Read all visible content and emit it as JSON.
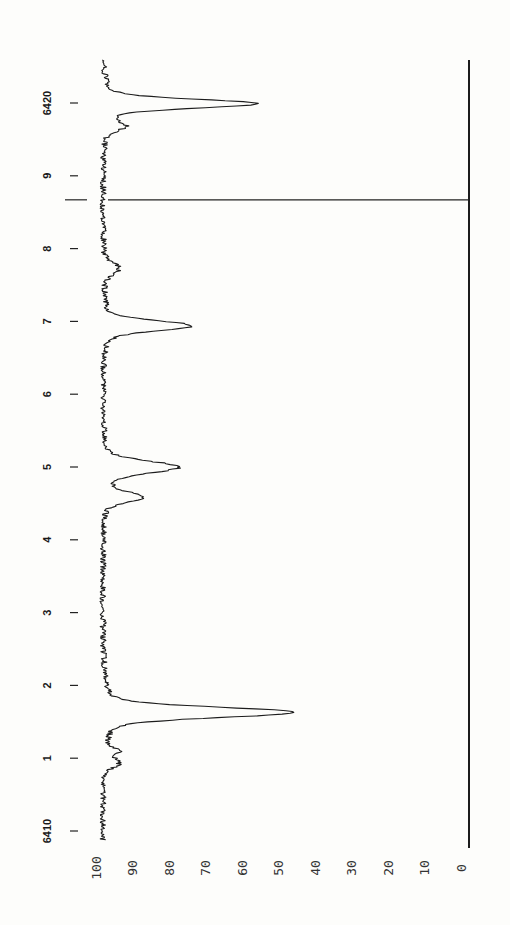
{
  "chart_data": {
    "type": "line",
    "title": "",
    "orientation": "rotated-90",
    "xlabel": "Wavelength",
    "ylabel": "Intensity (%)",
    "x_range": [
      6409.88,
      6420.59
    ],
    "ylim": [
      0,
      100
    ],
    "grid": false,
    "legend": null,
    "x_ticks": [
      {
        "value": 6410,
        "label": "6410"
      },
      {
        "value": 6411,
        "label": "1"
      },
      {
        "value": 6412,
        "label": "2"
      },
      {
        "value": 6413,
        "label": "3"
      },
      {
        "value": 6414,
        "label": "4"
      },
      {
        "value": 6415,
        "label": "5"
      },
      {
        "value": 6416,
        "label": "6"
      },
      {
        "value": 6417,
        "label": "7"
      },
      {
        "value": 6418,
        "label": "8"
      },
      {
        "value": 6419,
        "label": "9"
      },
      {
        "value": 6420,
        "label": "6420"
      }
    ],
    "y_ticks": [
      {
        "value": 100,
        "label": "100"
      },
      {
        "value": 90,
        "label": "90"
      },
      {
        "value": 80,
        "label": "80"
      },
      {
        "value": 70,
        "label": "70"
      },
      {
        "value": 60,
        "label": "60"
      },
      {
        "value": 50,
        "label": "50"
      },
      {
        "value": 40,
        "label": "40"
      },
      {
        "value": 30,
        "label": "30"
      },
      {
        "value": 20,
        "label": "20"
      },
      {
        "value": 10,
        "label": "10"
      },
      {
        "value": 0,
        "label": "0"
      }
    ],
    "continuum": 98.5,
    "noise_amplitude": 0.8,
    "absorption_lines": [
      {
        "x": 6410.93,
        "min": 94.5,
        "width": 0.06
      },
      {
        "x": 6411.09,
        "min": 95.0,
        "width": 0.05
      },
      {
        "x": 6411.63,
        "min": 46.0,
        "width": 0.07
      },
      {
        "x": 6414.59,
        "min": 88.0,
        "width": 0.07
      },
      {
        "x": 6415.0,
        "min": 78.0,
        "width": 0.08
      },
      {
        "x": 6416.94,
        "min": 74.5,
        "width": 0.07
      },
      {
        "x": 6417.73,
        "min": 94.0,
        "width": 0.08
      },
      {
        "x": 6419.68,
        "min": 93.0,
        "width": 0.06
      },
      {
        "x": 6419.99,
        "min": 56.5,
        "width": 0.06
      }
    ],
    "marker_line": {
      "x": 6418.67,
      "label": ""
    },
    "series": [
      {
        "name": "spectrum",
        "x": [
          6409.88,
          6410.5,
          6410.93,
          6411.09,
          6411.3,
          6411.63,
          6412.0,
          6413.0,
          6414.0,
          6414.59,
          6414.8,
          6415.0,
          6415.5,
          6416.0,
          6416.94,
          6417.3,
          6417.73,
          6418.0,
          6419.0,
          6419.68,
          6419.99,
          6420.3,
          6420.59
        ],
        "values": [
          98.5,
          98.5,
          94.5,
          95.0,
          97.8,
          46.0,
          97.5,
          98.3,
          98.5,
          88.0,
          96.5,
          78.0,
          97.5,
          98.5,
          74.5,
          97.5,
          94.0,
          98.3,
          98.5,
          93.0,
          56.5,
          97.0,
          98.5
        ]
      }
    ]
  }
}
